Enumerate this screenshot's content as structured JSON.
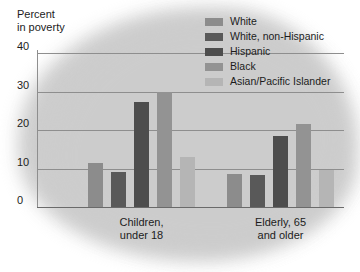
{
  "chart_data": {
    "type": "bar",
    "title": "",
    "ylabel": "Percent\nin poverty",
    "xlabel": "",
    "ylim": [
      0,
      40
    ],
    "yticks": [
      0,
      10,
      20,
      30,
      40
    ],
    "grid": true,
    "legend_position": "top-right",
    "categories": [
      "Children,\nunder 18",
      "Elderly, 65\nand older"
    ],
    "series": [
      {
        "name": "White",
        "color": "#8c8c8c",
        "values": [
          11.5,
          8.5
        ]
      },
      {
        "name": "White, non-Hispanic",
        "color": "#595959",
        "values": [
          9.0,
          8.3
        ]
      },
      {
        "name": "Hispanic",
        "color": "#4d4d4d",
        "values": [
          27.3,
          18.5
        ]
      },
      {
        "name": "Black",
        "color": "#939393",
        "values": [
          30.0,
          21.5
        ]
      },
      {
        "name": "Asian/Pacific Islander",
        "color": "#b5b5b5",
        "values": [
          13.0,
          9.5
        ]
      }
    ]
  },
  "axis": {
    "y_title": "Percent\nin poverty",
    "ticks": [
      {
        "label": "40",
        "value": 40
      },
      {
        "label": "30",
        "value": 30
      },
      {
        "label": "20",
        "value": 20
      },
      {
        "label": "10",
        "value": 10
      },
      {
        "label": "0",
        "value": 0
      }
    ]
  },
  "groups": [
    {
      "label": "Children,\nunder 18"
    },
    {
      "label": "Elderly, 65\nand older"
    }
  ],
  "legend": {
    "items": [
      {
        "label": "White",
        "color": "#8c8c8c"
      },
      {
        "label": "White, non-Hispanic",
        "color": "#595959"
      },
      {
        "label": "Hispanic",
        "color": "#4d4d4d"
      },
      {
        "label": "Black",
        "color": "#939393"
      },
      {
        "label": "Asian/Pacific Islander",
        "color": "#b5b5b5"
      }
    ]
  },
  "colors": {
    "background": "#ffffff",
    "blob": "#c9c9c9",
    "gridline": "#8e8e8e",
    "text": "#1c1c1c"
  }
}
